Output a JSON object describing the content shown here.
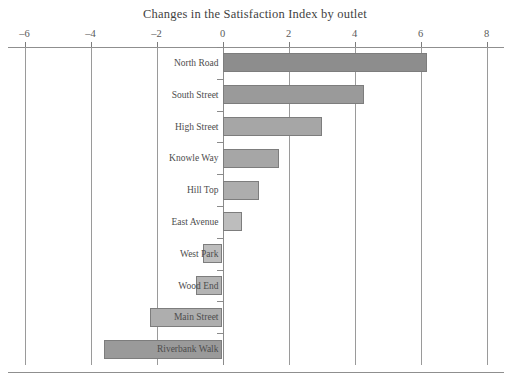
{
  "chart_data": {
    "type": "bar",
    "orientation": "horizontal",
    "title": "Changes in the Satisfaction Index by outlet",
    "xlabel": "",
    "ylabel": "",
    "xlim": [
      -6,
      8
    ],
    "grid": true,
    "legend": "none",
    "xticks": [
      -6,
      -4,
      -2,
      0,
      2,
      4,
      6,
      8
    ],
    "xtick_labels": [
      "–6",
      "–4",
      "–2",
      "0",
      "2",
      "4",
      "6",
      "8"
    ],
    "categories": [
      "North Road",
      "South Street",
      "High Street",
      "Knowle Way",
      "Hill Top",
      "East Avenue",
      "West Park",
      "Wood End",
      "Main Street",
      "Riverbank Walk"
    ],
    "values": [
      6.2,
      4.3,
      3.0,
      1.7,
      1.1,
      0.6,
      -0.6,
      -0.8,
      -2.2,
      -3.6
    ],
    "bar_colors": [
      "#8d8d8d",
      "#9a9a9a",
      "#a6a6a6",
      "#a6a6a6",
      "#adadad",
      "#bdbdbd",
      "#bdbdbd",
      "#b4b4b4",
      "#aeaeae",
      "#9a9a9a"
    ]
  },
  "colors": {
    "axis": "#8f8f8f",
    "gridline": "#9a9a9a",
    "text": "#4a4a4a",
    "bar_edge": "#7d7d7d"
  }
}
